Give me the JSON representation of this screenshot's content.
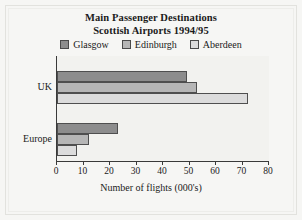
{
  "chart_data": {
    "type": "bar",
    "orientation": "horizontal",
    "title": "Main Passenger Destinations",
    "subtitle": "Scottish Airports  1994/95",
    "xlabel": "Number of flights  (000's)",
    "ylabel": "",
    "categories": [
      "UK",
      "Europe"
    ],
    "series": [
      {
        "name": "Glasgow",
        "color": "#8d8d8d",
        "values": [
          49,
          23
        ]
      },
      {
        "name": "Edinburgh",
        "color": "#b6b6b6",
        "values": [
          53,
          12
        ]
      },
      {
        "name": "Aberdeen",
        "color": "#dcdcdc",
        "values": [
          72,
          7.5
        ]
      }
    ],
    "xlim": [
      0,
      80
    ],
    "xticks": [
      0,
      10,
      20,
      30,
      40,
      50,
      60,
      70,
      80
    ],
    "xtick_labels": [
      "0",
      "10",
      "20",
      "30",
      "40",
      "50",
      "60",
      "70",
      "80"
    ],
    "grid": false,
    "legend_position": "top"
  },
  "colors": {
    "background": "#f6f6f4",
    "plot_background": "#f2f2ef",
    "axis": "#3a3a3a",
    "text": "#1b1b1b",
    "bar_outline": "#4f4f4f"
  }
}
